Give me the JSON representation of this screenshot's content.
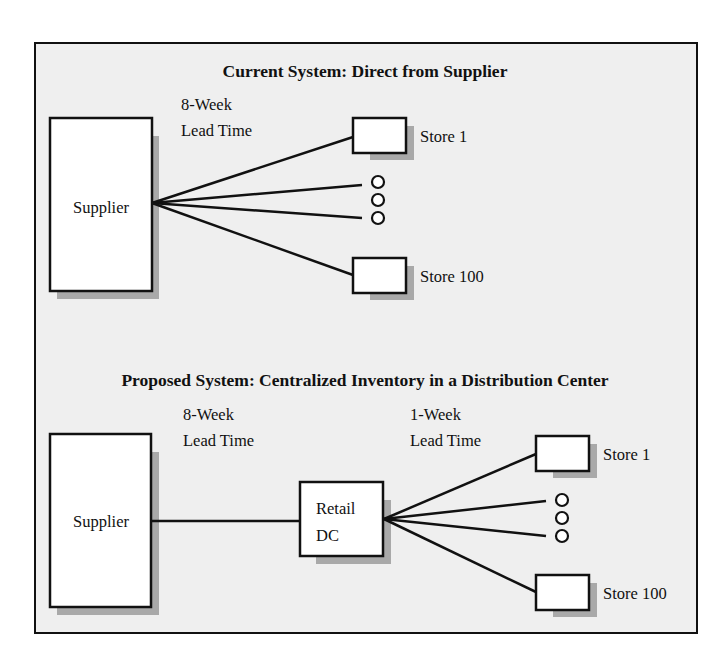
{
  "current_system": {
    "title": "Current System: Direct from Supplier",
    "supplier_label": "Supplier",
    "lead_time_line1": "8-Week",
    "lead_time_line2": "Lead Time",
    "stores": [
      {
        "label": "Store 1"
      },
      {
        "label": "Store 100"
      }
    ],
    "ellipsis": "three-circles"
  },
  "proposed_system": {
    "title": "Proposed System: Centralized Inventory in a Distribution Center",
    "supplier_label": "Supplier",
    "dc_label_line1": "Retail",
    "dc_label_line2": "DC",
    "supplier_lead_time_line1": "8-Week",
    "supplier_lead_time_line2": "Lead Time",
    "dc_lead_time_line1": "1-Week",
    "dc_lead_time_line2": "Lead Time",
    "stores": [
      {
        "label": "Store 1"
      },
      {
        "label": "Store 100"
      }
    ],
    "ellipsis": "three-circles"
  },
  "colors": {
    "background": "#efefef",
    "stroke": "#111111",
    "shadow": "#a9a9a9",
    "box_fill": "#ffffff"
  }
}
